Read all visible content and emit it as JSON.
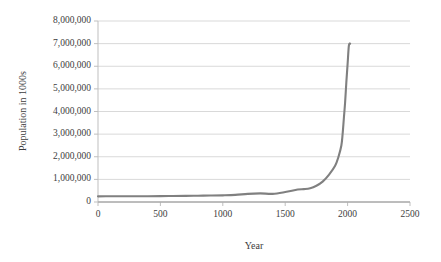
{
  "chart_data": {
    "type": "line",
    "title": "",
    "xlabel": "Year",
    "ylabel": "Population in 1000s",
    "xlim": [
      0,
      2500
    ],
    "ylim": [
      0,
      8000000
    ],
    "grid": true,
    "legend": null,
    "legend_position": "none",
    "line_color": "#808080",
    "gridline_color": "#d9d9d9",
    "axis_color": "#bfbfbf",
    "x_ticks": [
      0,
      500,
      1000,
      1500,
      2000,
      2500
    ],
    "x_tick_labels": [
      "0",
      "500",
      "1000",
      "1500",
      "2000",
      "2500"
    ],
    "y_ticks": [
      0,
      1000000,
      2000000,
      3000000,
      4000000,
      5000000,
      6000000,
      7000000,
      8000000
    ],
    "y_tick_labels": [
      "0",
      "1,000,000",
      "2,000,000",
      "3,000,000",
      "4,000,000",
      "5,000,000",
      "6,000,000",
      "7,000,000",
      "8,000,000"
    ],
    "series": [
      {
        "name": "World population",
        "x": [
          0,
          100,
          200,
          300,
          400,
          500,
          600,
          700,
          800,
          900,
          1000,
          1100,
          1200,
          1300,
          1400,
          1500,
          1600,
          1650,
          1700,
          1750,
          1800,
          1850,
          1900,
          1927,
          1950,
          1960,
          1970,
          1980,
          1990,
          2000,
          2010,
          2020
        ],
        "y": [
          250000,
          252000,
          257000,
          256000,
          257000,
          260000,
          265000,
          270000,
          278000,
          285000,
          295000,
          315000,
          360000,
          380000,
          360000,
          440000,
          550000,
          570000,
          610000,
          720000,
          900000,
          1200000,
          1600000,
          2000000,
          2500000,
          3000000,
          3700000,
          4400000,
          5300000,
          6100000,
          6900000,
          7000000
        ]
      }
    ]
  }
}
